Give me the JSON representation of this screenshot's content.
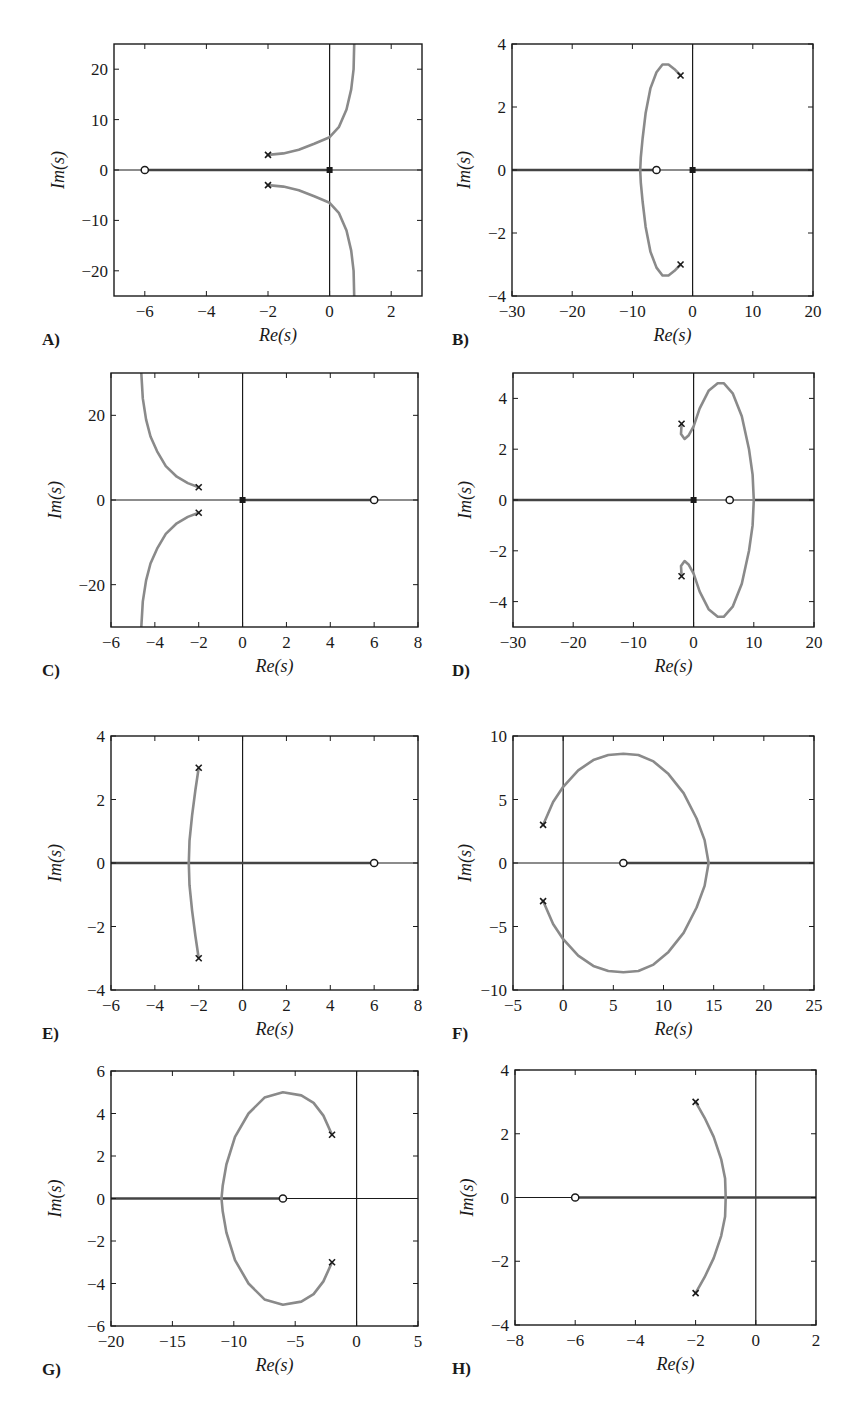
{
  "figure": {
    "width": 857,
    "height": 1412,
    "colors": {
      "axes": "#1a1a1a",
      "locus": "#8a8a8a",
      "real_axis_locus": "#444444",
      "marker": "#1a1a1a",
      "background": "#ffffff"
    }
  },
  "chart_data": [
    {
      "id": "A",
      "type": "line",
      "label": "A)",
      "title": "",
      "xlabel": "Re(s)",
      "ylabel": "Im(s)",
      "xlim": [
        -7,
        3
      ],
      "ylim": [
        -25,
        25
      ],
      "xticks": [
        -6,
        -4,
        -2,
        0,
        2
      ],
      "yticks": [
        -20,
        -10,
        0,
        10,
        20
      ],
      "grid": false,
      "box": {
        "x": 114,
        "y": 44,
        "w": 308,
        "h": 252
      },
      "poles": [
        [
          -2,
          3
        ],
        [
          -2,
          -3
        ]
      ],
      "origin_marker": true,
      "zeros": [
        [
          -6,
          0
        ]
      ],
      "real_axis_segments": [
        [
          -6,
          0
        ]
      ],
      "branches": [
        [
          [
            -2,
            3
          ],
          [
            -1.5,
            3.3
          ],
          [
            -1.0,
            4.0
          ],
          [
            -0.5,
            5.2
          ],
          [
            0,
            6.5
          ],
          [
            0.3,
            8.5
          ],
          [
            0.55,
            12
          ],
          [
            0.7,
            16
          ],
          [
            0.78,
            20
          ],
          [
            0.8,
            25
          ]
        ],
        [
          [
            -2,
            -3
          ],
          [
            -1.5,
            -3.3
          ],
          [
            -1.0,
            -4.0
          ],
          [
            -0.5,
            -5.2
          ],
          [
            0,
            -6.5
          ],
          [
            0.3,
            -8.5
          ],
          [
            0.55,
            -12
          ],
          [
            0.7,
            -16
          ],
          [
            0.78,
            -20
          ],
          [
            0.8,
            -25
          ]
        ]
      ]
    },
    {
      "id": "B",
      "type": "line",
      "label": "B)",
      "title": "",
      "xlabel": "Re(s)",
      "ylabel": "Im(s)",
      "xlim": [
        -30,
        20
      ],
      "ylim": [
        -4,
        4
      ],
      "xticks": [
        -30,
        -20,
        -10,
        0,
        10,
        20
      ],
      "yticks": [
        -4,
        -2,
        0,
        2,
        4
      ],
      "grid": false,
      "box": {
        "x": 512,
        "y": 44,
        "w": 301,
        "h": 252
      },
      "poles": [
        [
          -2,
          3
        ],
        [
          -2,
          -3
        ]
      ],
      "origin_marker": true,
      "zeros": [
        [
          -6,
          0
        ]
      ],
      "real_axis_segments": [
        [
          -30,
          -6
        ],
        [
          0,
          20
        ]
      ],
      "branches": [
        [
          [
            -2,
            3
          ],
          [
            -3,
            3.2
          ],
          [
            -4,
            3.35
          ],
          [
            -5,
            3.35
          ],
          [
            -6,
            3.1
          ],
          [
            -7,
            2.6
          ],
          [
            -7.8,
            1.8
          ],
          [
            -8.3,
            1.0
          ],
          [
            -8.6,
            0.4
          ],
          [
            -8.7,
            0
          ]
        ],
        [
          [
            -2,
            -3
          ],
          [
            -3,
            -3.2
          ],
          [
            -4,
            -3.35
          ],
          [
            -5,
            -3.35
          ],
          [
            -6,
            -3.1
          ],
          [
            -7,
            -2.6
          ],
          [
            -7.8,
            -1.8
          ],
          [
            -8.3,
            -1.0
          ],
          [
            -8.6,
            -0.4
          ],
          [
            -8.7,
            0
          ]
        ]
      ]
    },
    {
      "id": "C",
      "type": "line",
      "label": "C)",
      "title": "",
      "xlabel": "Re(s)",
      "ylabel": "Im(s)",
      "xlim": [
        -6,
        8
      ],
      "ylim": [
        -30,
        30
      ],
      "xticks": [
        -6,
        -4,
        -2,
        0,
        2,
        4,
        6,
        8
      ],
      "yticks": [
        -20,
        0,
        20
      ],
      "grid": false,
      "box": {
        "x": 111,
        "y": 373,
        "w": 307,
        "h": 254
      },
      "poles": [
        [
          -2,
          3
        ],
        [
          -2,
          -3
        ]
      ],
      "origin_marker": true,
      "zeros": [
        [
          6,
          0
        ]
      ],
      "real_axis_segments": [
        [
          0,
          6
        ]
      ],
      "branches": [
        [
          [
            -2,
            3
          ],
          [
            -2.5,
            4.0
          ],
          [
            -3.0,
            5.5
          ],
          [
            -3.5,
            8
          ],
          [
            -3.9,
            11.5
          ],
          [
            -4.2,
            15
          ],
          [
            -4.4,
            19
          ],
          [
            -4.55,
            24
          ],
          [
            -4.62,
            30
          ]
        ],
        [
          [
            -2,
            -3
          ],
          [
            -2.5,
            -4.0
          ],
          [
            -3.0,
            -5.5
          ],
          [
            -3.5,
            -8
          ],
          [
            -3.9,
            -11.5
          ],
          [
            -4.2,
            -15
          ],
          [
            -4.4,
            -19
          ],
          [
            -4.55,
            -24
          ],
          [
            -4.62,
            -30
          ]
        ]
      ]
    },
    {
      "id": "D",
      "type": "line",
      "label": "D)",
      "title": "",
      "xlabel": "Re(s)",
      "ylabel": "Im(s)",
      "xlim": [
        -30,
        20
      ],
      "ylim": [
        -5,
        5
      ],
      "xticks": [
        -30,
        -20,
        -10,
        0,
        10,
        20
      ],
      "yticks": [
        -4,
        -2,
        0,
        2,
        4
      ],
      "grid": false,
      "box": {
        "x": 513,
        "y": 373,
        "w": 301,
        "h": 254
      },
      "poles": [
        [
          -2,
          3
        ],
        [
          -2,
          -3
        ]
      ],
      "origin_marker": true,
      "zeros": [
        [
          6,
          0
        ]
      ],
      "real_axis_segments": [
        [
          -30,
          0
        ],
        [
          10,
          20
        ]
      ],
      "branches": [
        [
          [
            -2,
            3
          ],
          [
            -2.1,
            2.6
          ],
          [
            -1.5,
            2.4
          ],
          [
            -0.8,
            2.55
          ],
          [
            0,
            2.9
          ],
          [
            1,
            3.6
          ],
          [
            2.5,
            4.3
          ],
          [
            4,
            4.6
          ],
          [
            5,
            4.6
          ],
          [
            6.5,
            4.2
          ],
          [
            8,
            3.3
          ],
          [
            9.2,
            2.0
          ],
          [
            9.8,
            1.0
          ],
          [
            10,
            0
          ]
        ],
        [
          [
            -2,
            -3
          ],
          [
            -2.1,
            -2.6
          ],
          [
            -1.5,
            -2.4
          ],
          [
            -0.8,
            -2.55
          ],
          [
            0,
            -2.9
          ],
          [
            1,
            -3.6
          ],
          [
            2.5,
            -4.3
          ],
          [
            4,
            -4.6
          ],
          [
            5,
            -4.6
          ],
          [
            6.5,
            -4.2
          ],
          [
            8,
            -3.3
          ],
          [
            9.2,
            -2.0
          ],
          [
            9.8,
            -1.0
          ],
          [
            10,
            0
          ]
        ]
      ]
    },
    {
      "id": "E",
      "type": "line",
      "label": "E)",
      "title": "",
      "xlabel": "Re(s)",
      "ylabel": "Im(s)",
      "xlim": [
        -6,
        8
      ],
      "ylim": [
        -4,
        4
      ],
      "xticks": [
        -6,
        -4,
        -2,
        0,
        2,
        4,
        6,
        8
      ],
      "yticks": [
        -4,
        -2,
        0,
        2,
        4
      ],
      "grid": false,
      "box": {
        "x": 111,
        "y": 736,
        "w": 307,
        "h": 254
      },
      "poles": [
        [
          -2,
          3
        ],
        [
          -2,
          -3
        ]
      ],
      "origin_marker": false,
      "zeros": [
        [
          6,
          0
        ]
      ],
      "real_axis_segments": [
        [
          -6,
          6
        ]
      ],
      "branches": [
        [
          [
            -2,
            3
          ],
          [
            -2.15,
            2.3
          ],
          [
            -2.3,
            1.5
          ],
          [
            -2.42,
            0.7
          ],
          [
            -2.45,
            0
          ]
        ],
        [
          [
            -2,
            -3
          ],
          [
            -2.15,
            -2.3
          ],
          [
            -2.3,
            -1.5
          ],
          [
            -2.42,
            -0.7
          ],
          [
            -2.45,
            0
          ]
        ]
      ]
    },
    {
      "id": "F",
      "type": "line",
      "label": "F)",
      "title": "",
      "xlabel": "Re(s)",
      "ylabel": "Im(s)",
      "xlim": [
        -5,
        25
      ],
      "ylim": [
        -10,
        10
      ],
      "xticks": [
        -5,
        0,
        5,
        10,
        15,
        20,
        25
      ],
      "yticks": [
        -10,
        -5,
        0,
        5,
        10
      ],
      "grid": false,
      "box": {
        "x": 513,
        "y": 736,
        "w": 301,
        "h": 254
      },
      "poles": [
        [
          -2,
          3
        ],
        [
          -2,
          -3
        ]
      ],
      "origin_marker": false,
      "zeros": [
        [
          6,
          0
        ]
      ],
      "real_axis_segments": [
        [
          6,
          25
        ]
      ],
      "branches": [
        [
          [
            -2,
            3
          ],
          [
            -1,
            4.8
          ],
          [
            0,
            6.0
          ],
          [
            1.5,
            7.3
          ],
          [
            3,
            8.1
          ],
          [
            4.5,
            8.5
          ],
          [
            6,
            8.6
          ],
          [
            7.5,
            8.5
          ],
          [
            9,
            8.0
          ],
          [
            10.5,
            7.0
          ],
          [
            12,
            5.5
          ],
          [
            13.3,
            3.5
          ],
          [
            14.1,
            1.8
          ],
          [
            14.5,
            0
          ]
        ],
        [
          [
            -2,
            -3
          ],
          [
            -1,
            -4.8
          ],
          [
            0,
            -6.0
          ],
          [
            1.5,
            -7.3
          ],
          [
            3,
            -8.1
          ],
          [
            4.5,
            -8.5
          ],
          [
            6,
            -8.6
          ],
          [
            7.5,
            -8.5
          ],
          [
            9,
            -8.0
          ],
          [
            10.5,
            -7.0
          ],
          [
            12,
            -5.5
          ],
          [
            13.3,
            -3.5
          ],
          [
            14.1,
            -1.8
          ],
          [
            14.5,
            0
          ]
        ]
      ]
    },
    {
      "id": "G",
      "type": "line",
      "label": "G)",
      "title": "",
      "xlabel": "Re(s)",
      "ylabel": "Im(s)",
      "xlim": [
        -20,
        5
      ],
      "ylim": [
        -6,
        6
      ],
      "xticks": [
        -20,
        -15,
        -10,
        -5,
        0,
        5
      ],
      "yticks": [
        -6,
        -4,
        -2,
        0,
        2,
        4,
        6
      ],
      "grid": false,
      "box": {
        "x": 111,
        "y": 1071,
        "w": 307,
        "h": 255
      },
      "poles": [
        [
          -2,
          3
        ],
        [
          -2,
          -3
        ]
      ],
      "origin_marker": false,
      "zeros": [
        [
          -6,
          0
        ]
      ],
      "real_axis_segments": [
        [
          -20,
          -6
        ]
      ],
      "branches": [
        [
          [
            -2,
            3
          ],
          [
            -2.7,
            3.9
          ],
          [
            -3.5,
            4.5
          ],
          [
            -4.5,
            4.85
          ],
          [
            -6,
            5.0
          ],
          [
            -7.5,
            4.75
          ],
          [
            -8.8,
            4.0
          ],
          [
            -9.9,
            2.9
          ],
          [
            -10.6,
            1.6
          ],
          [
            -10.9,
            0.6
          ],
          [
            -11,
            0
          ]
        ],
        [
          [
            -2,
            -3
          ],
          [
            -2.7,
            -3.9
          ],
          [
            -3.5,
            -4.5
          ],
          [
            -4.5,
            -4.85
          ],
          [
            -6,
            -5.0
          ],
          [
            -7.5,
            -4.75
          ],
          [
            -8.8,
            -4.0
          ],
          [
            -9.9,
            -2.9
          ],
          [
            -10.6,
            -1.6
          ],
          [
            -10.9,
            -0.6
          ],
          [
            -11,
            0
          ]
        ]
      ]
    },
    {
      "id": "H",
      "type": "line",
      "label": "H)",
      "title": "",
      "xlabel": "Re(s)",
      "ylabel": "Im(s)",
      "xlim": [
        -8,
        2
      ],
      "ylim": [
        -4,
        4
      ],
      "xticks": [
        -8,
        -6,
        -4,
        -2,
        0,
        2
      ],
      "yticks": [
        -4,
        -2,
        0,
        2,
        4
      ],
      "grid": false,
      "box": {
        "x": 515,
        "y": 1070,
        "w": 301,
        "h": 255
      },
      "poles": [
        [
          -2,
          3
        ],
        [
          -2,
          -3
        ]
      ],
      "origin_marker": false,
      "zeros": [
        [
          -6,
          0
        ]
      ],
      "real_axis_segments": [
        [
          -6,
          2
        ]
      ],
      "branches": [
        [
          [
            -2,
            3
          ],
          [
            -1.7,
            2.5
          ],
          [
            -1.4,
            1.9
          ],
          [
            -1.15,
            1.2
          ],
          [
            -1.02,
            0.6
          ],
          [
            -1.0,
            0
          ]
        ],
        [
          [
            -2,
            -3
          ],
          [
            -1.7,
            -2.5
          ],
          [
            -1.4,
            -1.9
          ],
          [
            -1.15,
            -1.2
          ],
          [
            -1.02,
            -0.6
          ],
          [
            -1.0,
            0
          ]
        ]
      ]
    }
  ]
}
